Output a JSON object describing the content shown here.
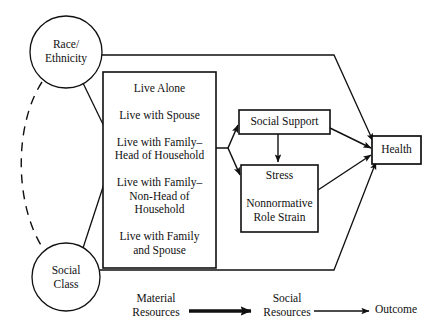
{
  "diagram": {
    "type": "conceptual-path-diagram",
    "background": "#ffffff",
    "stroke_color": "#101010"
  },
  "nodes": {
    "race_ethnicity": {
      "label_line1": "Race/",
      "label_line2": "Ethnicity",
      "shape": "circle",
      "cx": 66,
      "cy": 52,
      "r": 36
    },
    "social_class": {
      "label_line1": "Social",
      "label_line2": "Class",
      "shape": "circle",
      "cx": 66,
      "cy": 277,
      "r": 34
    },
    "living_arrangements": {
      "shape": "rect",
      "x": 103,
      "y": 72,
      "w": 113,
      "h": 196,
      "items": [
        "Live Alone",
        "Live with Spouse",
        "Live with Family–\nHead of Household",
        "Live with Family–\nNon-Head of\nHousehold",
        "Live with Family\nand Spouse"
      ]
    },
    "social_support": {
      "label": "Social Support",
      "shape": "rect",
      "x": 239,
      "y": 110,
      "w": 91,
      "h": 24
    },
    "stress": {
      "label_line1": "Stress",
      "label_line2": "Nonnormative",
      "label_line3": "Role Strain",
      "shape": "rect",
      "x": 241,
      "y": 165,
      "w": 77,
      "h": 67
    },
    "health": {
      "label": "Health",
      "shape": "rect",
      "x": 372,
      "y": 136,
      "w": 49,
      "h": 28
    }
  },
  "legend": {
    "material_resources": "Material\nResources",
    "social_resources": "Social\nResources",
    "outcome": "Outcome",
    "thick_arrow_meaning": "Material Resources → Social Resources",
    "thin_arrow_meaning": "Social Resources → Outcome"
  },
  "edges": [
    {
      "from": "race_ethnicity",
      "to": "living_arrangements",
      "style": "solid-arrow"
    },
    {
      "from": "social_class",
      "to": "living_arrangements",
      "style": "solid-arrow"
    },
    {
      "from": "race_ethnicity",
      "to": "social_class",
      "style": "dashed-curve"
    },
    {
      "from": "race_ethnicity",
      "to": "health",
      "style": "solid-arrow-elbow-top"
    },
    {
      "from": "social_class",
      "to": "health",
      "style": "solid-arrow-elbow-bottom"
    },
    {
      "from": "living_arrangements",
      "to": "social_support",
      "style": "fork-arrow"
    },
    {
      "from": "living_arrangements",
      "to": "stress",
      "style": "fork-arrow"
    },
    {
      "from": "social_support",
      "to": "stress",
      "style": "solid-arrow-vertical"
    },
    {
      "from": "social_support",
      "to": "health",
      "style": "solid-arrow"
    },
    {
      "from": "stress",
      "to": "health",
      "style": "solid-arrow"
    }
  ]
}
